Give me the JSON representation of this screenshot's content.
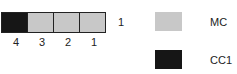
{
  "colors": {
    "MC": "#c8c8c8",
    "CC1": "#161616"
  },
  "strip": {
    "row_label": "1",
    "cells": [
      {
        "label": "4",
        "class": "CC1"
      },
      {
        "label": "3",
        "class": "MC"
      },
      {
        "label": "2",
        "class": "MC"
      },
      {
        "label": "1",
        "class": "MC"
      }
    ]
  },
  "legend": [
    {
      "label": "MC",
      "color": "#c8c8c8"
    },
    {
      "label": "CC1",
      "color": "#161616"
    }
  ]
}
